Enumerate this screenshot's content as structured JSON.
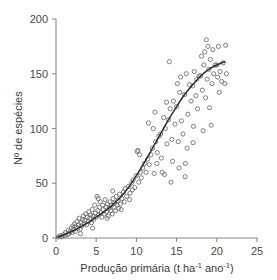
{
  "chart_data": {
    "type": "scatter",
    "title": "",
    "subtitle": "",
    "xlabel_parts": {
      "main": "Produção primária (t ha",
      "sup1": "-1",
      "mid": " ano",
      "sup2": "-1",
      "end": ")"
    },
    "xlabel": "Produção primária (t ha-1 ano-1)",
    "ylabel": "Nº de espécies",
    "xlim": [
      0,
      25
    ],
    "ylim": [
      0,
      200
    ],
    "xticks": [
      0,
      5,
      10,
      15,
      20,
      25
    ],
    "yticks": [
      0,
      50,
      100,
      150,
      200
    ],
    "xticklabels": [
      "0",
      "5",
      "10",
      "15",
      "20",
      "25"
    ],
    "yticklabels": [
      "0",
      "50",
      "100",
      "150",
      "200"
    ],
    "grid": false,
    "legend": "none",
    "marker": "open-circle",
    "marker_color": "#6b6b6b",
    "curve_color": "#2e2e2e",
    "axis_color": "#8a8a8a",
    "fit_curve": {
      "name": "sigmoid fit",
      "description": "smooth sigmoidal trend rising from 0 near x=0 to about 160 at x=21",
      "x": [
        0.2,
        1,
        2,
        3,
        4,
        5,
        6,
        7,
        8,
        9,
        10,
        11,
        12,
        13,
        14,
        15,
        16,
        17,
        18,
        19,
        20,
        21
      ],
      "y": [
        1,
        3,
        6,
        10,
        14,
        19,
        24,
        30,
        37,
        46,
        57,
        69,
        82,
        95,
        108,
        120,
        131,
        140,
        148,
        154,
        158,
        161
      ]
    },
    "series": [
      {
        "name": "observations",
        "points": [
          [
            0.3,
            1
          ],
          [
            0.5,
            2
          ],
          [
            0.7,
            1
          ],
          [
            0.9,
            3
          ],
          [
            1.1,
            2
          ],
          [
            1.2,
            5
          ],
          [
            1.4,
            3
          ],
          [
            1.5,
            7
          ],
          [
            1.6,
            4
          ],
          [
            1.8,
            6
          ],
          [
            1.9,
            9
          ],
          [
            2.0,
            5
          ],
          [
            2.1,
            11
          ],
          [
            2.2,
            8
          ],
          [
            2.3,
            13
          ],
          [
            2.4,
            6
          ],
          [
            2.5,
            10
          ],
          [
            2.6,
            15
          ],
          [
            2.7,
            9
          ],
          [
            2.8,
            12
          ],
          [
            2.9,
            18
          ],
          [
            3.0,
            8
          ],
          [
            3.1,
            14
          ],
          [
            3.2,
            11
          ],
          [
            3.3,
            17
          ],
          [
            3.4,
            20
          ],
          [
            3.5,
            13
          ],
          [
            3.6,
            16
          ],
          [
            3.7,
            22
          ],
          [
            3.8,
            12
          ],
          [
            3.9,
            19
          ],
          [
            4.0,
            15
          ],
          [
            4.1,
            24
          ],
          [
            4.2,
            18
          ],
          [
            4.3,
            21
          ],
          [
            4.4,
            14
          ],
          [
            4.5,
            26
          ],
          [
            4.6,
            20
          ],
          [
            4.7,
            17
          ],
          [
            4.8,
            30
          ],
          [
            4.9,
            23
          ],
          [
            5.0,
            19
          ],
          [
            5.1,
            38
          ],
          [
            5.2,
            25
          ],
          [
            5.3,
            21
          ],
          [
            5.4,
            28
          ],
          [
            5.5,
            33
          ],
          [
            5.6,
            23
          ],
          [
            5.7,
            19
          ],
          [
            5.8,
            30
          ],
          [
            5.9,
            26
          ],
          [
            6.0,
            22
          ],
          [
            6.1,
            35
          ],
          [
            6.2,
            28
          ],
          [
            6.3,
            24
          ],
          [
            6.4,
            31
          ],
          [
            6.5,
            20
          ],
          [
            6.6,
            27
          ],
          [
            6.7,
            33
          ],
          [
            6.8,
            25
          ],
          [
            6.9,
            30
          ],
          [
            7.0,
            22
          ],
          [
            7.1,
            36
          ],
          [
            7.2,
            28
          ],
          [
            7.3,
            32
          ],
          [
            7.4,
            25
          ],
          [
            7.5,
            38
          ],
          [
            7.6,
            30
          ],
          [
            7.7,
            34
          ],
          [
            7.8,
            27
          ],
          [
            7.9,
            40
          ],
          [
            8.0,
            31
          ],
          [
            8.2,
            36
          ],
          [
            8.4,
            42
          ],
          [
            8.5,
            33
          ],
          [
            8.6,
            45
          ],
          [
            8.8,
            38
          ],
          [
            9.0,
            47
          ],
          [
            9.2,
            41
          ],
          [
            9.4,
            50
          ],
          [
            9.5,
            44
          ],
          [
            9.6,
            53
          ],
          [
            9.8,
            46
          ],
          [
            10.0,
            57
          ],
          [
            10.1,
            79
          ],
          [
            10.2,
            80
          ],
          [
            10.3,
            51
          ],
          [
            10.4,
            76
          ],
          [
            10.5,
            60
          ],
          [
            10.6,
            55
          ],
          [
            10.8,
            64
          ],
          [
            11.0,
            68
          ],
          [
            11.2,
            60
          ],
          [
            11.4,
            72
          ],
          [
            11.5,
            105
          ],
          [
            11.6,
            67
          ],
          [
            11.8,
            76
          ],
          [
            12.0,
            82
          ],
          [
            12.1,
            100
          ],
          [
            12.2,
            59
          ],
          [
            12.3,
            115
          ],
          [
            12.4,
            88
          ],
          [
            12.6,
            78
          ],
          [
            12.8,
            93
          ],
          [
            13.0,
            95
          ],
          [
            13.1,
            73
          ],
          [
            13.2,
            60
          ],
          [
            13.4,
            110
          ],
          [
            13.5,
            58
          ],
          [
            13.6,
            100
          ],
          [
            13.8,
            86
          ],
          [
            14.0,
            108
          ],
          [
            14.1,
            161
          ],
          [
            14.2,
            118
          ],
          [
            14.3,
            51
          ],
          [
            14.4,
            90
          ],
          [
            14.5,
            70
          ],
          [
            14.6,
            125
          ],
          [
            14.8,
            104
          ],
          [
            15.0,
            120
          ],
          [
            15.1,
            141
          ],
          [
            15.2,
            88
          ],
          [
            15.3,
            64
          ],
          [
            15.4,
            133
          ],
          [
            15.5,
            147
          ],
          [
            15.6,
            107
          ],
          [
            15.8,
            95
          ],
          [
            16.0,
            131
          ],
          [
            16.1,
            68
          ],
          [
            16.2,
            150
          ],
          [
            16.3,
            82
          ],
          [
            16.4,
            113
          ],
          [
            16.6,
            140
          ],
          [
            16.8,
            125
          ],
          [
            17.0,
            139
          ],
          [
            17.1,
            102
          ],
          [
            17.2,
            152
          ],
          [
            17.4,
            130
          ],
          [
            17.5,
            145
          ],
          [
            17.6,
            118
          ],
          [
            17.8,
            148
          ],
          [
            18.0,
            148
          ],
          [
            18.1,
            166
          ],
          [
            18.2,
            135
          ],
          [
            18.3,
            98
          ],
          [
            18.4,
            158
          ],
          [
            18.5,
            170
          ],
          [
            18.6,
            128
          ],
          [
            18.7,
            181
          ],
          [
            18.8,
            145
          ],
          [
            18.9,
            175
          ],
          [
            19.0,
            154
          ],
          [
            19.1,
            119
          ],
          [
            19.2,
            163
          ],
          [
            19.3,
            103
          ],
          [
            19.4,
            141
          ],
          [
            19.5,
            172
          ],
          [
            19.6,
            150
          ],
          [
            19.8,
            158
          ],
          [
            20.0,
            158
          ],
          [
            20.1,
            147
          ],
          [
            20.2,
            175
          ],
          [
            20.3,
            133
          ],
          [
            20.4,
            152
          ],
          [
            20.6,
            143
          ],
          [
            20.8,
            160
          ],
          [
            21.0,
            141
          ],
          [
            21.1,
            176
          ],
          [
            21.2,
            150
          ],
          [
            3.05,
            4
          ],
          [
            4.55,
            9
          ],
          [
            5.25,
            36
          ],
          [
            6.35,
            18
          ],
          [
            7.05,
            43
          ],
          [
            8.1,
            26
          ],
          [
            9.15,
            35
          ],
          [
            12.55,
            68
          ],
          [
            13.75,
            124
          ],
          [
            16.05,
            56
          ],
          [
            17.05,
            87
          ]
        ]
      }
    ]
  }
}
